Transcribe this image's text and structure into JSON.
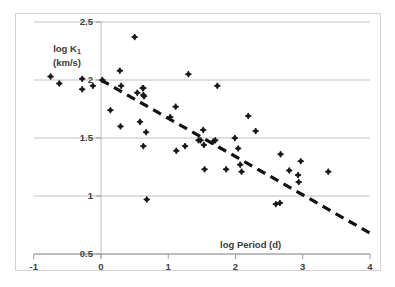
{
  "chart_data": {
    "type": "scatter",
    "title": "",
    "xlabel": "log Period (d)",
    "ylabel": "log K₁ (km/s)",
    "ylabel_line1": "log K",
    "ylabel_sub": "1",
    "ylabel_line2": "(km/s)",
    "xlim": [
      -1,
      4
    ],
    "ylim": [
      0.5,
      2.5
    ],
    "xticks": [
      -1,
      0,
      1,
      2,
      3,
      4
    ],
    "xtick_labels": [
      "-1",
      "0",
      "1",
      "2",
      "3",
      "4"
    ],
    "yticks": [
      0.5,
      1,
      1.5,
      2,
      2.5
    ],
    "ytick_labels": [
      "0.5",
      "1",
      "1.5",
      "2",
      "2.5"
    ],
    "grid": "horizontal",
    "legend": "none",
    "marker": "diamond",
    "marker_color": "#1a1a1a",
    "gridline_color": "#bfbfbf",
    "border_color": "#d2d2d2",
    "points": [
      [
        -0.75,
        2.03
      ],
      [
        -0.62,
        1.97
      ],
      [
        -0.28,
        2.01
      ],
      [
        -0.28,
        1.92
      ],
      [
        -0.12,
        1.95
      ],
      [
        0.02,
        2.0
      ],
      [
        0.14,
        1.74
      ],
      [
        0.28,
        2.08
      ],
      [
        0.3,
        1.95
      ],
      [
        0.29,
        1.6
      ],
      [
        0.5,
        2.37
      ],
      [
        0.54,
        1.89
      ],
      [
        0.58,
        1.64
      ],
      [
        0.62,
        1.93
      ],
      [
        0.63,
        1.93
      ],
      [
        0.63,
        1.87
      ],
      [
        0.64,
        1.86
      ],
      [
        0.63,
        1.43
      ],
      [
        0.67,
        1.55
      ],
      [
        0.68,
        0.97
      ],
      [
        1.03,
        1.68
      ],
      [
        1.11,
        1.77
      ],
      [
        1.12,
        1.39
      ],
      [
        1.25,
        1.43
      ],
      [
        1.3,
        2.05
      ],
      [
        1.45,
        1.48
      ],
      [
        1.48,
        1.48
      ],
      [
        1.52,
        1.57
      ],
      [
        1.53,
        1.44
      ],
      [
        1.54,
        1.23
      ],
      [
        1.67,
        1.47
      ],
      [
        1.7,
        1.48
      ],
      [
        1.73,
        1.95
      ],
      [
        1.86,
        1.23
      ],
      [
        1.99,
        1.5
      ],
      [
        2.04,
        1.41
      ],
      [
        2.07,
        1.27
      ],
      [
        2.09,
        1.21
      ],
      [
        2.19,
        1.69
      ],
      [
        2.3,
        1.56
      ],
      [
        2.6,
        0.93
      ],
      [
        2.66,
        0.94
      ],
      [
        2.67,
        1.36
      ],
      [
        2.8,
        1.22
      ],
      [
        2.93,
        1.18
      ],
      [
        2.94,
        1.12
      ],
      [
        2.97,
        1.3
      ],
      [
        3.38,
        1.21
      ]
    ],
    "trendline": {
      "style": "dashed",
      "color": "#111111",
      "x_start": 0,
      "y_start": 2.0,
      "x_end": 4,
      "y_end": 0.68
    }
  }
}
